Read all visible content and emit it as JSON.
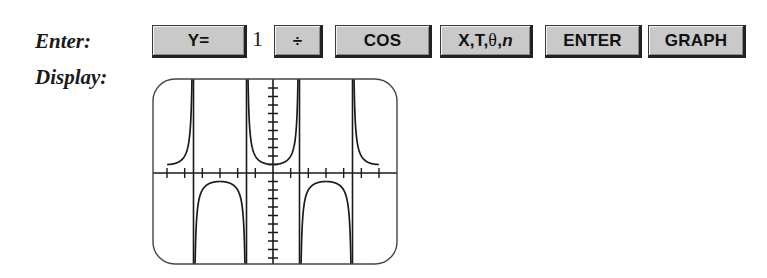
{
  "labels": {
    "enter": "Enter:",
    "display": "Display:"
  },
  "keystrokes": [
    {
      "type": "key",
      "label": "Y=",
      "name": "key-y-equals"
    },
    {
      "type": "text",
      "label": "1",
      "name": "digit-1"
    },
    {
      "type": "key",
      "label": "÷",
      "name": "key-divide"
    },
    {
      "type": "key",
      "label": "COS",
      "name": "key-cos"
    },
    {
      "type": "key",
      "label": "X,T,θ,n",
      "name": "key-x-t-theta-n"
    },
    {
      "type": "key",
      "label": "ENTER",
      "name": "key-enter"
    },
    {
      "type": "key",
      "label": "GRAPH",
      "name": "key-graph"
    }
  ],
  "keys": {
    "y_equals": "Y=",
    "one": "1",
    "divide": "÷",
    "cos": "COS",
    "xt_prefix": "X,T,",
    "xt_theta": "θ",
    "xt_sep": ",",
    "xt_n": "n",
    "enter": "ENTER",
    "graph": "GRAPH"
  },
  "colors": {
    "key_fill": "#c9c9c9",
    "key_border": "#222222",
    "ink": "#1a1a1a",
    "screen_border": "#444444"
  },
  "chart_data": {
    "type": "line",
    "title": "",
    "function": "y = 1/cos(x)",
    "series": [
      {
        "name": "1/cos(x)",
        "domain": [
          -6.2832,
          6.2832
        ]
      }
    ],
    "xlabel": "",
    "ylabel": "",
    "xlim": [
      -7.3,
      7.3
    ],
    "ylim": [
      -11,
      11
    ],
    "x_tick_step": 1.0472,
    "x_ticks_count_each_side": 6,
    "y_tick_step": 1,
    "y_ticks_count_each_side": 10,
    "asymptotes_x": [
      -4.7124,
      -1.5708,
      1.5708,
      4.7124
    ],
    "local_extrema": [
      {
        "x": -6.2832,
        "y": 1
      },
      {
        "x": -3.1416,
        "y": -1
      },
      {
        "x": 0,
        "y": 1
      },
      {
        "x": 3.1416,
        "y": -1
      },
      {
        "x": 6.2832,
        "y": 1
      }
    ],
    "grid": false,
    "legend": "none"
  }
}
